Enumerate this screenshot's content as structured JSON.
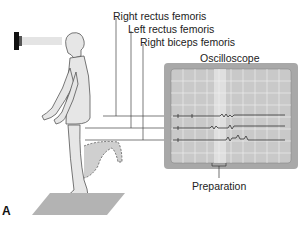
{
  "figure": {
    "panel_label": "A",
    "labels": {
      "right_rectus_femoris": "Right rectus femoris",
      "left_rectus_femoris": "Left rectus femoris",
      "right_biceps_femoris": "Right biceps femoris",
      "oscilloscope": "Oscilloscope",
      "preparation": "Preparation"
    },
    "colors": {
      "screen_bezel": "#a8a8a8",
      "screen": "#c9c9c9",
      "grid": "#f2f2f2",
      "figure_fill": "#e6e6e6",
      "floor_plate": "#b3b3b3",
      "lines": "#444444"
    }
  }
}
